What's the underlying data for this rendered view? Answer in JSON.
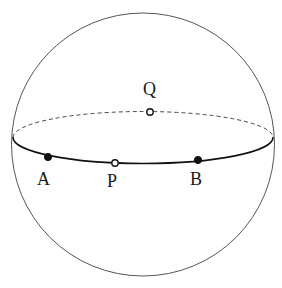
{
  "figure": {
    "background_color": "#ffffff",
    "width": 282,
    "height": 288,
    "stroke_color_sphere": "#555555",
    "stroke_color_equator": "#111111",
    "stroke_color_hidden": "#444444"
  },
  "sphere": {
    "name": "sphere-outline",
    "cx": 143,
    "cy": 144.5,
    "r": 131.5,
    "stroke_width": 1.0
  },
  "equator": {
    "name": "great-circle-ellipse",
    "cx": 143,
    "cy": 137.5,
    "rx": 130,
    "ry": 26,
    "front_stroke_width": 1.6,
    "back_stroke_width": 1.0,
    "back_dash": "4 3"
  },
  "points": [
    {
      "id": "A",
      "label": "A",
      "x": 48,
      "y": 157,
      "style": "filled",
      "radius": 3.6,
      "label_x": 37,
      "label_y": 170
    },
    {
      "id": "P",
      "label": "P",
      "x": 115,
      "y": 163,
      "style": "hollow",
      "radius": 3.2,
      "label_x": 107,
      "label_y": 172
    },
    {
      "id": "B",
      "label": "B",
      "x": 198,
      "y": 160,
      "style": "filled",
      "radius": 3.6,
      "label_x": 190,
      "label_y": 170
    },
    {
      "id": "Q",
      "label": "Q",
      "x": 150,
      "y": 112,
      "style": "hollow",
      "radius": 3.2,
      "label_x": 143,
      "label_y": 80
    }
  ]
}
